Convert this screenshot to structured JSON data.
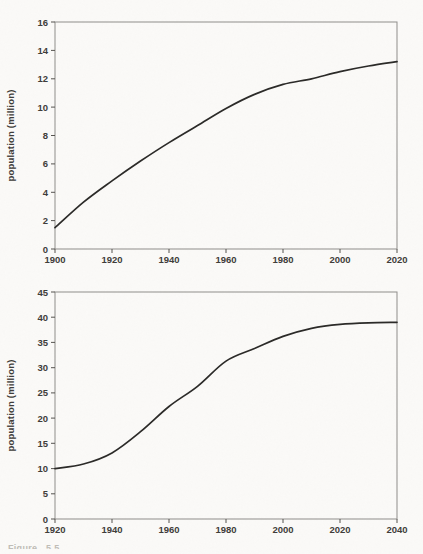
{
  "page": {
    "background_color": "#fbfaf8",
    "curve_color": "#2a2927",
    "axis_color": "#8f8d8a",
    "text_color": "#3e3c39"
  },
  "caption": {
    "text": "Figure 5.5"
  },
  "chart_data": [
    {
      "type": "line",
      "title": "",
      "xlabel": "",
      "ylabel": "population (million)",
      "xlim": [
        1900,
        2020
      ],
      "ylim": [
        0,
        16
      ],
      "x_ticks": [
        1900,
        1920,
        1940,
        1960,
        1980,
        2000,
        2020
      ],
      "y_ticks": [
        0,
        2,
        4,
        6,
        8,
        10,
        12,
        14,
        16
      ],
      "grid": false,
      "legend": null,
      "line_color": "#2a2927",
      "x": [
        1900,
        1910,
        1920,
        1930,
        1940,
        1950,
        1960,
        1970,
        1980,
        1990,
        2000,
        2010,
        2020
      ],
      "values": [
        1.5,
        3.3,
        4.8,
        6.2,
        7.5,
        8.7,
        9.9,
        10.9,
        11.6,
        12.0,
        12.5,
        12.9,
        13.2
      ]
    },
    {
      "type": "line",
      "title": "",
      "xlabel": "",
      "ylabel": "population (million)",
      "xlim": [
        1920,
        2040
      ],
      "ylim": [
        0,
        45
      ],
      "x_ticks": [
        1920,
        1940,
        1960,
        1980,
        2000,
        2020,
        2040
      ],
      "y_ticks": [
        0,
        5,
        10,
        15,
        20,
        25,
        30,
        35,
        40,
        45
      ],
      "grid": false,
      "legend": null,
      "line_color": "#2a2927",
      "x": [
        1920,
        1930,
        1940,
        1950,
        1960,
        1970,
        1980,
        1990,
        2000,
        2010,
        2020,
        2030,
        2040
      ],
      "values": [
        10,
        10.9,
        13.1,
        17.3,
        22.3,
        26.3,
        31.3,
        33.8,
        36.2,
        37.8,
        38.6,
        38.9,
        39.0
      ]
    }
  ]
}
